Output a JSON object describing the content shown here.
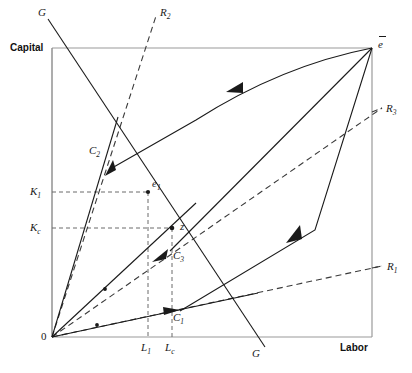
{
  "figure": {
    "type": "economics-diagram",
    "axes": {
      "y_label": "Capital",
      "x_label": "Labor",
      "origin_label": "0"
    },
    "box": {
      "left": 52,
      "top": 48,
      "right": 372,
      "bottom": 337
    },
    "tick_labels": {
      "y": [
        {
          "text": "K",
          "sub": "1",
          "x": 30,
          "y": 186
        },
        {
          "text": "K",
          "sub": "c",
          "x": 30,
          "y": 222
        }
      ],
      "x": [
        {
          "text": "L",
          "sub": "1",
          "x": 134,
          "y": 343
        },
        {
          "text": "L",
          "sub": "c",
          "x": 167,
          "y": 343
        }
      ]
    },
    "point_labels": [
      {
        "name": "C2",
        "text": "C",
        "sub": "2",
        "x": 90,
        "y": 145
      },
      {
        "name": "e1",
        "text": "e",
        "sub": "1",
        "x": 152,
        "y": 179
      },
      {
        "name": "z",
        "text": "z",
        "sub": "",
        "x": 180,
        "y": 222
      },
      {
        "name": "C3",
        "text": "C",
        "sub": "3",
        "x": 173,
        "y": 250
      },
      {
        "name": "C1",
        "text": "C",
        "sub": "1",
        "x": 173,
        "y": 313
      },
      {
        "name": "R1",
        "text": "R",
        "sub": "1",
        "x": 387,
        "y": 261
      },
      {
        "name": "R2",
        "text": "R",
        "sub": "2",
        "x": 160,
        "y": 8
      },
      {
        "name": "R3",
        "text": "R",
        "sub": "3",
        "x": 386,
        "y": 103
      },
      {
        "name": "G-top",
        "text": "G",
        "sub": "",
        "x": 38,
        "y": 7
      },
      {
        "name": "G-bottom",
        "text": "G",
        "sub": "",
        "x": 252,
        "y": 349
      }
    ],
    "endowment_label": "e",
    "colors": {
      "line": "#1a1a1a",
      "box_border": "#9a9a9a",
      "dashed_guide": "#6a6a6a",
      "background": "#ffffff"
    },
    "geometry": {
      "rays_from_origin": [
        {
          "name": "ray-to-C2",
          "to_x": 132,
          "to_y": 132
        },
        {
          "name": "ray-to-C3",
          "to_x": 196,
          "to_y": 205
        },
        {
          "name": "ray-to-C1",
          "to_x": 250,
          "to_y": 296
        }
      ],
      "dashed_rays": [
        {
          "name": "R1",
          "x1": 52,
          "y1": 337,
          "x2": 382,
          "y2": 266
        },
        {
          "name": "R2",
          "x1": 52,
          "y1": 337,
          "x2": 156,
          "y2": 16
        },
        {
          "name": "R3",
          "x1": 52,
          "y1": 337,
          "x2": 382,
          "y2": 108
        }
      ],
      "G_line": {
        "x1": 48,
        "y1": 19,
        "x2": 265,
        "y2": 347
      },
      "key_points": [
        {
          "name": "e1",
          "x": 148,
          "y": 192
        },
        {
          "name": "z",
          "x": 172,
          "y": 228
        },
        {
          "name": "C2",
          "x": 109,
          "y": 165
        },
        {
          "name": "C3",
          "x": 165,
          "y": 252
        },
        {
          "name": "C1",
          "x": 177,
          "y": 310
        },
        {
          "name": "ebar",
          "x": 372,
          "y": 48
        }
      ]
    }
  }
}
